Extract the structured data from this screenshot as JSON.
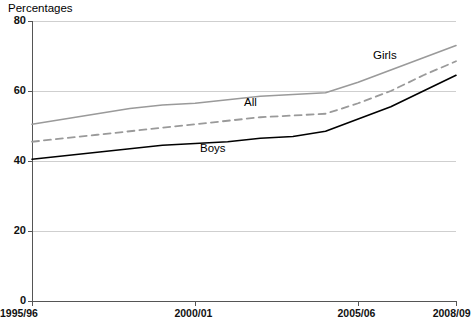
{
  "chart_data": {
    "type": "line",
    "title": "Percentages",
    "xlabel": "",
    "ylabel": "",
    "ylim": [
      0,
      80
    ],
    "ytick_values": [
      0,
      20,
      40,
      60,
      80
    ],
    "ytick_labels": [
      "0",
      "20",
      "40",
      "60",
      "80"
    ],
    "grid": true,
    "legend_position": "inline-labels",
    "x": [
      "1995/96",
      "1996/97",
      "1997/98",
      "1998/99",
      "1999/00",
      "2000/01",
      "2001/02",
      "2002/03",
      "2003/04",
      "2004/05",
      "2005/06",
      "2006/07",
      "2007/08",
      "2008/09"
    ],
    "xtick_labels": [
      "1995/96",
      "2000/01",
      "2005/06",
      "2008/09"
    ],
    "xtick_indices": [
      0,
      5,
      10,
      13
    ],
    "series": [
      {
        "name": "Girls",
        "color": "#9a9a9a",
        "style": "solid",
        "values": [
          50.5,
          52.0,
          53.5,
          55.0,
          56.0,
          56.5,
          57.5,
          58.5,
          59.0,
          59.5,
          62.5,
          66.0,
          69.5,
          73.0
        ]
      },
      {
        "name": "All",
        "color": "#9a9a9a",
        "style": "dashed",
        "values": [
          45.5,
          46.5,
          47.5,
          48.5,
          49.5,
          50.5,
          51.5,
          52.5,
          53.0,
          53.5,
          56.5,
          60.0,
          64.5,
          68.5
        ]
      },
      {
        "name": "Boys",
        "color": "#000000",
        "style": "solid",
        "values": [
          40.5,
          41.5,
          42.5,
          43.5,
          44.5,
          45.0,
          45.5,
          46.5,
          47.0,
          48.5,
          52.0,
          55.5,
          60.0,
          64.5
        ]
      }
    ],
    "annotations": [
      {
        "text": "Girls",
        "x_px": 373,
        "y_px": 49
      },
      {
        "text": "All",
        "x_px": 244,
        "y_px": 96
      },
      {
        "text": "Boys",
        "x_px": 200,
        "y_px": 142
      }
    ]
  }
}
